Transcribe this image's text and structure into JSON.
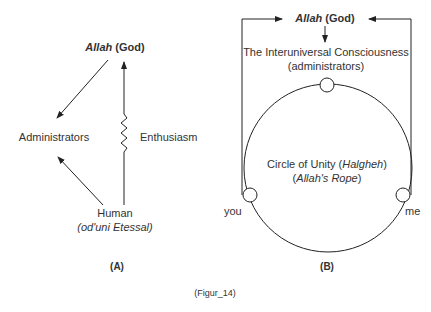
{
  "panel_a": {
    "top_node": {
      "name_italic": "Allah",
      "name_rest": " (God)"
    },
    "left_node": "Administrators",
    "right_label": "Enthusiasm",
    "bottom_node": {
      "line1": "Human",
      "line2": "(od'uni Etessal)"
    },
    "caption": "(A)"
  },
  "panel_b": {
    "top_node": {
      "name_italic": "Allah",
      "name_rest": " (God)"
    },
    "consciousness": {
      "line1": "The Interuniversal Consciousness",
      "line2": "(administrators)"
    },
    "circle": {
      "line1_pre": "Circle of Unity (",
      "line1_italic": "Halgheh",
      "line1_post": ")",
      "line2_pre": "(",
      "line2_italic": "Allah's Rope",
      "line2_post": ")"
    },
    "left_label": "you",
    "right_label": "me",
    "caption": "(B)"
  },
  "figure_caption": "(Figur_14)"
}
